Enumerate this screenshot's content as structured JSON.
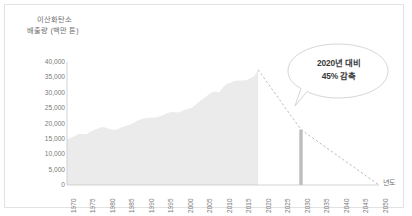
{
  "chart_data": {
    "type": "area",
    "title": "",
    "ylabel_line1": "이산화탄소",
    "ylabel_line2": "배출량 (백만 톤)",
    "xlabel": "년도",
    "ylim": [
      0,
      40000
    ],
    "xlim": [
      1970,
      2050
    ],
    "grid": false,
    "legend": "none",
    "y_ticks": [
      "40,000",
      "35,000",
      "30,000",
      "25,000",
      "20,000",
      "15,000",
      "10,000",
      "5,000",
      "0"
    ],
    "y_tick_values": [
      40000,
      35000,
      30000,
      25000,
      20000,
      15000,
      10000,
      5000,
      0
    ],
    "x_ticks": [
      "1970",
      "1975",
      "1980",
      "1985",
      "1990",
      "1995",
      "2000",
      "2005",
      "2010",
      "2015",
      "2020",
      "2025",
      "2030",
      "2035",
      "2040",
      "2045",
      "2050"
    ],
    "x_tick_values": [
      1970,
      1975,
      1980,
      1985,
      1990,
      1995,
      2000,
      2005,
      2010,
      2015,
      2020,
      2025,
      2030,
      2035,
      2040,
      2045,
      2050
    ],
    "series": [
      {
        "name": "historical-emissions",
        "type": "area",
        "color": "#ebebeb",
        "x": [
          1970,
          1971,
          1972,
          1973,
          1974,
          1975,
          1976,
          1977,
          1978,
          1979,
          1980,
          1981,
          1982,
          1983,
          1984,
          1985,
          1986,
          1987,
          1988,
          1989,
          1990,
          1991,
          1992,
          1993,
          1994,
          1995,
          1996,
          1997,
          1998,
          1999,
          2000,
          2001,
          2002,
          2003,
          2004,
          2005,
          2006,
          2007,
          2008,
          2009,
          2010,
          2011,
          2012,
          2013,
          2014,
          2015,
          2016,
          2017,
          2018,
          2019
        ],
        "values": [
          14900,
          15300,
          15900,
          16700,
          16600,
          16500,
          17300,
          17900,
          18400,
          18900,
          18600,
          18100,
          18000,
          18100,
          18800,
          19200,
          19600,
          20200,
          20900,
          21400,
          21700,
          21900,
          21900,
          22000,
          22400,
          22900,
          23500,
          23700,
          23600,
          23700,
          24400,
          24700,
          25100,
          26100,
          27200,
          28100,
          29100,
          30100,
          30400,
          30100,
          31800,
          32900,
          33300,
          33800,
          34000,
          34000,
          34100,
          34700,
          35400,
          37500
        ]
      },
      {
        "name": "reduction-pathway",
        "type": "line",
        "style": "dashed",
        "color": "#b4b4b4",
        "x": [
          2019,
          2030,
          2050
        ],
        "values": [
          37500,
          18000,
          0
        ]
      },
      {
        "name": "target-2030-bar",
        "type": "bar",
        "color": "#bdbdbd",
        "x": [
          2030
        ],
        "values": [
          18000
        ]
      }
    ],
    "annotations": [
      {
        "name": "reduction-callout",
        "line1": "2020년 대비",
        "line2": "45% 감축",
        "points_to_year": 2030,
        "points_to_value": 18000
      }
    ]
  },
  "colors": {
    "area_fill": "#ebebeb",
    "bar_fill": "#bdbdbd",
    "dashed_line": "#b4b4b4",
    "axis_line": "#c8c8c8",
    "frame_border": "#e2e2e2",
    "tick_text": "#7a7a7a",
    "title_text": "#6d6d6d",
    "callout_text": "#3a3a3a"
  }
}
